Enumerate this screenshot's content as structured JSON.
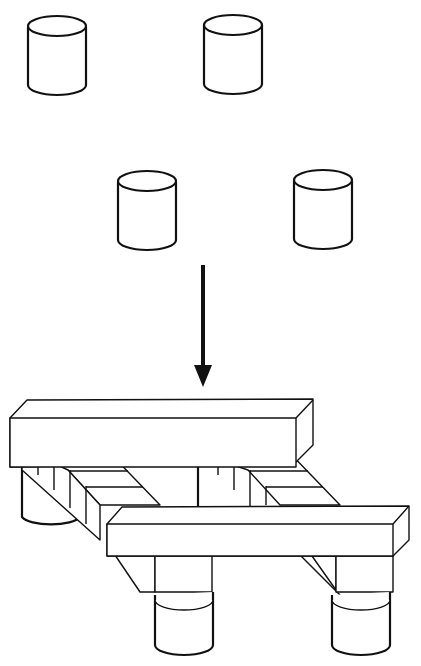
{
  "diagram": {
    "parts": {
      "cylinders": [
        {
          "id": "cyl-top-left",
          "cx": 57,
          "cy": 26
        },
        {
          "id": "cyl-top-right",
          "cx": 233,
          "cy": 25
        },
        {
          "id": "cyl-mid-left",
          "cx": 147,
          "cy": 181
        },
        {
          "id": "cyl-mid-right",
          "cx": 323,
          "cy": 180
        }
      ],
      "arrow": {
        "direction": "down",
        "x": 203,
        "y1": 265,
        "y2": 385
      },
      "assembly": {
        "beams": 2,
        "crossbars": 2,
        "support_cylinders": 4
      }
    },
    "colors": {
      "stroke": "#111111",
      "fill": "#ffffff"
    }
  }
}
